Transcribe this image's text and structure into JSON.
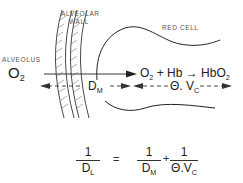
{
  "labels": {
    "alveolar_wall_line1": "ALVEOLAR",
    "alveolar_wall_line2": "WALL",
    "alveolus": "ALVEOLUS",
    "red_cell": "RED CELL"
  },
  "species": {
    "o2_left": "O",
    "o2_left_sub": "2",
    "reaction_o2": "O",
    "reaction_o2_sub": "2",
    "reaction_plus": " + Hb ",
    "reaction_arrow": "→",
    "reaction_product": " HbO",
    "reaction_product_sub": "2"
  },
  "arrows": {
    "dm_label": "D",
    "dm_sub": "M",
    "theta_vc_label": "Θ. V",
    "theta_vc_sub": "C"
  },
  "equation": {
    "lhs_num": "1",
    "lhs_den": "D",
    "lhs_den_sub": "L",
    "equals": "=",
    "term1_num": "1",
    "term1_den": "D",
    "term1_den_sub": "M",
    "plus": "+",
    "term2_num": "1",
    "term2_den": "Θ.V",
    "term2_den_sub": "C"
  },
  "colors": {
    "line": "#222222",
    "hatch": "#777777",
    "label": "#555555"
  }
}
